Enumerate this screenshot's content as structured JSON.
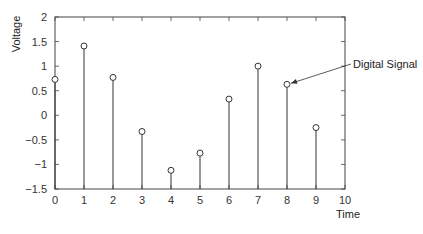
{
  "chart_data": {
    "type": "stem",
    "title": "",
    "xlabel": "Time",
    "ylabel": "Voltage",
    "x": [
      0,
      1,
      2,
      3,
      4,
      5,
      6,
      7,
      8,
      9
    ],
    "values": [
      0.73,
      1.41,
      0.77,
      -0.33,
      -1.12,
      -0.77,
      0.33,
      1.0,
      0.63,
      -0.25
    ],
    "xlim": [
      0,
      10
    ],
    "ylim": [
      -1.5,
      2
    ],
    "xticks": [
      "0",
      "1",
      "2",
      "3",
      "4",
      "5",
      "6",
      "7",
      "8",
      "9",
      "10"
    ],
    "yticks": [
      "2",
      "1.5",
      "1",
      "0.5",
      "0",
      "-0.5",
      "-1",
      "-1.5"
    ],
    "ytick_values": [
      2,
      1.5,
      1,
      0.5,
      0,
      -0.5,
      -1,
      -1.5
    ],
    "grid": false,
    "legend": null,
    "annotations": [
      {
        "text": "Digital Signal",
        "points_to_index": 8
      }
    ],
    "colors": {
      "stem": "#333333",
      "axis": "#444444",
      "marker_fill": "#ffffff"
    }
  }
}
